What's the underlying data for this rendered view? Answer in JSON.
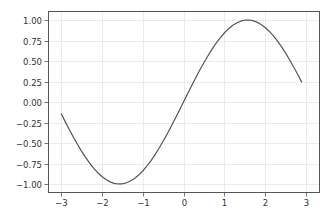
{
  "chart_data": {
    "type": "line",
    "title": "",
    "xlabel": "",
    "ylabel": "",
    "xlim": [
      -3.3,
      3.2
    ],
    "ylim": [
      -1.1,
      1.1
    ],
    "grid": true,
    "legend": null,
    "xticks": [
      -3,
      -2,
      -1,
      0,
      1,
      2,
      3
    ],
    "xtick_labels": [
      "−3",
      "−2",
      "−1",
      "0",
      "1",
      "2",
      "3"
    ],
    "yticks": [
      1.0,
      0.75,
      0.5,
      0.25,
      0.0,
      -0.25,
      -0.5,
      -0.75,
      -1.0
    ],
    "ytick_labels": [
      "1.00",
      "0.75",
      "0.50",
      "0.25",
      "0.00",
      "−0.25",
      "−0.50",
      "−0.75",
      "−1.00"
    ],
    "series": [
      {
        "name": "sin(x)",
        "color": "#555555",
        "function": "sin",
        "x_start": -3.0,
        "x_end": 2.9,
        "x_step": 0.1,
        "x": [
          -3.0,
          -2.5,
          -2.0,
          -1.5708,
          -1.0,
          -0.5,
          0.0,
          0.5,
          1.0,
          1.5708,
          2.0,
          2.5,
          2.9
        ],
        "y": [
          -0.141,
          -0.598,
          -0.909,
          -1.0,
          -0.841,
          -0.479,
          0.0,
          0.479,
          0.841,
          1.0,
          0.909,
          0.598,
          0.239
        ]
      }
    ]
  }
}
